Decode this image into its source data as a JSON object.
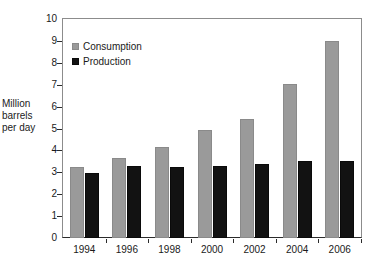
{
  "chart_data": {
    "type": "bar",
    "title": "",
    "subtitle": "",
    "xlabel": "",
    "ylabel": "Million barrels per day",
    "ylabel_lines": [
      "Million",
      "barrels",
      "per day"
    ],
    "categories": [
      "1994",
      "1996",
      "1998",
      "2000",
      "2002",
      "2004",
      "2006"
    ],
    "series": [
      {
        "name": "Consumption",
        "color": "#9a9a9a",
        "values": [
          3.25,
          3.65,
          4.15,
          4.95,
          5.45,
          7.05,
          9.0
        ]
      },
      {
        "name": "Production",
        "color": "#121212",
        "values": [
          2.95,
          3.27,
          3.25,
          3.3,
          3.4,
          3.5,
          3.5
        ]
      }
    ],
    "ylim": [
      0,
      10
    ],
    "y_ticks": [
      "0",
      "1",
      "2",
      "3",
      "4",
      "5",
      "6",
      "7",
      "8",
      "9",
      "10"
    ],
    "grid": false,
    "legend_position": "top-left",
    "axis_color": "#2b2b2b",
    "frame_color": "#8c8c8c",
    "background": "#ffffff"
  }
}
